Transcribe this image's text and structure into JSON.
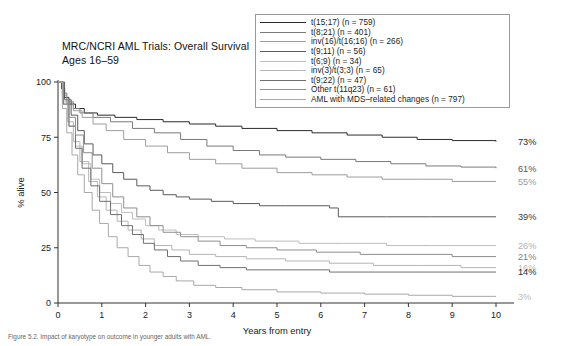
{
  "title": "MRC/NCRI AML Trials: Overall Survival\nAges 16–59",
  "caption": "Figure 5.2. Impact of karyotype on outcome in younger adults with AML.",
  "axes": {
    "ylabel": "% alive",
    "xlabel": "Years from entry",
    "yticks": [
      "0",
      "25",
      "50",
      "75",
      "100"
    ],
    "xticks": [
      "0",
      "1",
      "2",
      "3",
      "4",
      "5",
      "6",
      "7",
      "8",
      "9",
      "10"
    ]
  },
  "legend": {
    "items": [
      {
        "label": "t(15;17) (n = 759)",
        "color": "#2b2b2b"
      },
      {
        "label": "t(8;21) (n = 401)",
        "color": "#7a7a7a"
      },
      {
        "label": "inv(16)/t(16;16) (n = 266)",
        "color": "#9d9d9d"
      },
      {
        "label": "t(9;11) (n = 56)",
        "color": "#5a5a5a"
      },
      {
        "label": "t(6;9) (n = 34)",
        "color": "#bdbdbd"
      },
      {
        "label": "inv(3)/t(3;3) (n = 65)",
        "color": "#b5b5b5"
      },
      {
        "label": "t(9;22) (n = 47)",
        "color": "#6f6f6f"
      },
      {
        "label": "Other t(11q23) (n = 61)",
        "color": "#8e8e8e"
      },
      {
        "label": "AML with MDS–related changes (n = 797)",
        "color": "#a8a8a8"
      }
    ]
  },
  "chart_data": {
    "type": "line",
    "title": "MRC/NCRI AML Trials: Overall Survival Ages 16–59",
    "xlabel": "Years from entry",
    "ylabel": "% alive",
    "xlim": [
      0,
      10
    ],
    "ylim": [
      0,
      100
    ],
    "grid": false,
    "legend_position": "top-right",
    "end_labels": [
      "73%",
      "61%",
      "55%",
      "39%",
      "26%",
      "21%",
      "16%",
      "14%",
      "3%"
    ],
    "series": [
      {
        "name": "t(15;17) (n = 759)",
        "n": 759,
        "end_label": "73%",
        "end_label_color": "#2b2b2b",
        "color": "#2b2b2b",
        "points": [
          [
            0,
            100
          ],
          [
            0.08,
            97
          ],
          [
            0.15,
            93
          ],
          [
            0.25,
            90
          ],
          [
            0.4,
            88
          ],
          [
            0.6,
            86
          ],
          [
            0.9,
            85
          ],
          [
            1.3,
            84
          ],
          [
            1.8,
            83
          ],
          [
            2.4,
            82
          ],
          [
            3.0,
            81
          ],
          [
            3.6,
            80
          ],
          [
            4.2,
            79
          ],
          [
            5.0,
            78
          ],
          [
            5.8,
            77
          ],
          [
            6.6,
            76
          ],
          [
            7.4,
            75
          ],
          [
            8.2,
            74
          ],
          [
            9.0,
            73.5
          ],
          [
            10,
            73
          ]
        ]
      },
      {
        "name": "t(8;21) (n = 401)",
        "n": 401,
        "end_label": "61%",
        "end_label_color": "#555555",
        "color": "#7a7a7a",
        "points": [
          [
            0,
            100
          ],
          [
            0.1,
            95
          ],
          [
            0.2,
            91
          ],
          [
            0.35,
            88
          ],
          [
            0.5,
            86
          ],
          [
            0.8,
            84
          ],
          [
            1.2,
            82
          ],
          [
            1.7,
            79
          ],
          [
            2.2,
            77
          ],
          [
            2.8,
            74
          ],
          [
            3.4,
            71
          ],
          [
            4.0,
            69
          ],
          [
            4.6,
            67
          ],
          [
            5.2,
            66
          ],
          [
            6.0,
            65
          ],
          [
            6.8,
            64
          ],
          [
            7.6,
            63
          ],
          [
            8.4,
            62
          ],
          [
            9.2,
            61.5
          ],
          [
            10,
            61
          ]
        ]
      },
      {
        "name": "inv(16)/t(16;16) (n = 266)",
        "n": 266,
        "end_label": "55%",
        "end_label_color": "#9a9a9a",
        "color": "#9d9d9d",
        "points": [
          [
            0,
            100
          ],
          [
            0.1,
            94
          ],
          [
            0.2,
            90
          ],
          [
            0.35,
            87
          ],
          [
            0.55,
            84
          ],
          [
            0.8,
            81
          ],
          [
            1.1,
            78
          ],
          [
            1.5,
            74
          ],
          [
            2.0,
            71
          ],
          [
            2.5,
            68
          ],
          [
            3.0,
            65
          ],
          [
            3.6,
            63
          ],
          [
            4.2,
            61
          ],
          [
            5.0,
            59
          ],
          [
            5.8,
            58
          ],
          [
            6.6,
            57
          ],
          [
            7.4,
            56
          ],
          [
            8.2,
            56
          ],
          [
            9.0,
            55
          ],
          [
            10,
            55
          ]
        ]
      },
      {
        "name": "t(9;11) (n = 56)",
        "n": 56,
        "end_label": "39%",
        "end_label_color": "#3a3a3a",
        "color": "#5a5a5a",
        "points": [
          [
            0,
            100
          ],
          [
            0.15,
            92
          ],
          [
            0.3,
            85
          ],
          [
            0.45,
            78
          ],
          [
            0.6,
            72
          ],
          [
            0.8,
            67
          ],
          [
            1.0,
            63
          ],
          [
            1.25,
            59
          ],
          [
            1.5,
            56
          ],
          [
            1.8,
            53
          ],
          [
            2.1,
            51
          ],
          [
            2.4,
            49
          ],
          [
            2.7,
            48
          ],
          [
            3.0,
            47
          ],
          [
            3.5,
            46
          ],
          [
            4.0,
            45
          ],
          [
            4.6,
            44
          ],
          [
            5.2,
            44
          ],
          [
            6.2,
            43
          ],
          [
            6.4,
            39
          ],
          [
            7.5,
            39
          ],
          [
            8.5,
            39
          ],
          [
            10,
            39
          ]
        ]
      },
      {
        "name": "t(6;9) (n = 34)",
        "n": 34,
        "end_label": "26%",
        "end_label_color": "#b0b0b0",
        "color": "#bdbdbd",
        "points": [
          [
            0,
            100
          ],
          [
            0.12,
            90
          ],
          [
            0.25,
            80
          ],
          [
            0.4,
            71
          ],
          [
            0.55,
            63
          ],
          [
            0.75,
            56
          ],
          [
            0.95,
            50
          ],
          [
            1.2,
            45
          ],
          [
            1.45,
            41
          ],
          [
            1.7,
            38
          ],
          [
            2.0,
            35
          ],
          [
            2.3,
            33
          ],
          [
            2.7,
            31
          ],
          [
            3.2,
            30
          ],
          [
            3.8,
            29
          ],
          [
            4.5,
            28
          ],
          [
            5.5,
            27
          ],
          [
            6.5,
            27
          ],
          [
            7.5,
            26
          ],
          [
            8.5,
            26
          ],
          [
            10,
            26
          ]
        ]
      },
      {
        "name": "inv(3)/t(3;3) (n = 65)",
        "n": 65,
        "end_label": "16%",
        "end_label_color": "#bbbbbb",
        "color": "#b5b5b5",
        "points": [
          [
            0,
            100
          ],
          [
            0.1,
            91
          ],
          [
            0.22,
            82
          ],
          [
            0.35,
            73
          ],
          [
            0.5,
            64
          ],
          [
            0.7,
            55
          ],
          [
            0.9,
            48
          ],
          [
            1.1,
            42
          ],
          [
            1.35,
            37
          ],
          [
            1.6,
            33
          ],
          [
            1.9,
            29
          ],
          [
            2.2,
            26
          ],
          [
            2.6,
            24
          ],
          [
            3.0,
            22
          ],
          [
            3.6,
            21
          ],
          [
            4.3,
            20
          ],
          [
            5.2,
            19
          ],
          [
            6.2,
            18
          ],
          [
            7.2,
            17
          ],
          [
            8.2,
            17
          ],
          [
            9.2,
            16
          ],
          [
            10,
            16
          ]
        ]
      },
      {
        "name": "t(9;22) (n = 47)",
        "n": 47,
        "end_label": "14%",
        "end_label_color": "#2f2f2f",
        "color": "#6f6f6f",
        "points": [
          [
            0,
            100
          ],
          [
            0.12,
            90
          ],
          [
            0.25,
            80
          ],
          [
            0.4,
            70
          ],
          [
            0.55,
            61
          ],
          [
            0.75,
            53
          ],
          [
            0.95,
            46
          ],
          [
            1.2,
            40
          ],
          [
            1.45,
            35
          ],
          [
            1.7,
            31
          ],
          [
            1.95,
            27
          ],
          [
            2.2,
            24
          ],
          [
            2.5,
            21
          ],
          [
            2.8,
            19
          ],
          [
            3.2,
            17
          ],
          [
            3.7,
            16
          ],
          [
            4.3,
            15
          ],
          [
            5.2,
            15
          ],
          [
            6.2,
            14
          ],
          [
            7.2,
            14
          ],
          [
            8.2,
            14
          ],
          [
            9.0,
            14
          ],
          [
            10,
            14
          ]
        ]
      },
      {
        "name": "Other t(11q23) (n = 61)",
        "n": 61,
        "end_label": "21%",
        "end_label_color": "#7d7d7d",
        "color": "#8e8e8e",
        "points": [
          [
            0,
            100
          ],
          [
            0.12,
            92
          ],
          [
            0.25,
            84
          ],
          [
            0.4,
            76
          ],
          [
            0.58,
            68
          ],
          [
            0.78,
            61
          ],
          [
            1.0,
            54
          ],
          [
            1.25,
            48
          ],
          [
            1.5,
            43
          ],
          [
            1.8,
            39
          ],
          [
            2.1,
            35
          ],
          [
            2.4,
            32
          ],
          [
            2.8,
            30
          ],
          [
            3.2,
            28
          ],
          [
            3.7,
            26
          ],
          [
            4.3,
            25
          ],
          [
            5.0,
            24
          ],
          [
            5.9,
            23
          ],
          [
            6.9,
            22
          ],
          [
            7.9,
            22
          ],
          [
            9.0,
            21
          ],
          [
            10,
            21
          ]
        ]
      },
      {
        "name": "AML with MDS–related changes (n = 797)",
        "n": 797,
        "end_label": "3%",
        "end_label_color": "#bbbbbb",
        "color": "#a8a8a8",
        "points": [
          [
            0,
            100
          ],
          [
            0.1,
            88
          ],
          [
            0.2,
            77
          ],
          [
            0.32,
            67
          ],
          [
            0.45,
            58
          ],
          [
            0.6,
            50
          ],
          [
            0.78,
            42
          ],
          [
            0.95,
            36
          ],
          [
            1.15,
            30
          ],
          [
            1.35,
            25
          ],
          [
            1.6,
            21
          ],
          [
            1.85,
            17
          ],
          [
            2.1,
            14
          ],
          [
            2.4,
            12
          ],
          [
            2.7,
            10
          ],
          [
            3.1,
            8
          ],
          [
            3.6,
            7
          ],
          [
            4.2,
            6
          ],
          [
            5.0,
            5
          ],
          [
            6.0,
            4.5
          ],
          [
            7.0,
            4
          ],
          [
            8.0,
            3.5
          ],
          [
            9.0,
            3
          ],
          [
            10,
            3
          ]
        ]
      }
    ]
  }
}
